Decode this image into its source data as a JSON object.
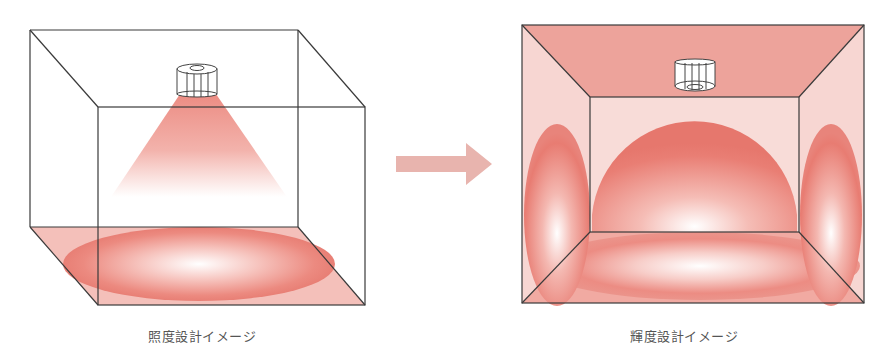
{
  "diagram": {
    "left_panel": {
      "caption": "照度設計イメージ",
      "description": "Illuminance design: light cone from ceiling fixture onto floor"
    },
    "arrow": {
      "direction": "right",
      "color": "#e8b4ae"
    },
    "right_panel": {
      "caption": "輝度設計イメージ",
      "description": "Luminance design: light distributed to walls, ceiling and floor"
    },
    "colors": {
      "line": "#3a3a3a",
      "light_red": "#e8736a",
      "pale_pink": "#f6d3cf",
      "ceiling_pink": "#eda39b",
      "arrow": "#e8b4ae"
    }
  }
}
